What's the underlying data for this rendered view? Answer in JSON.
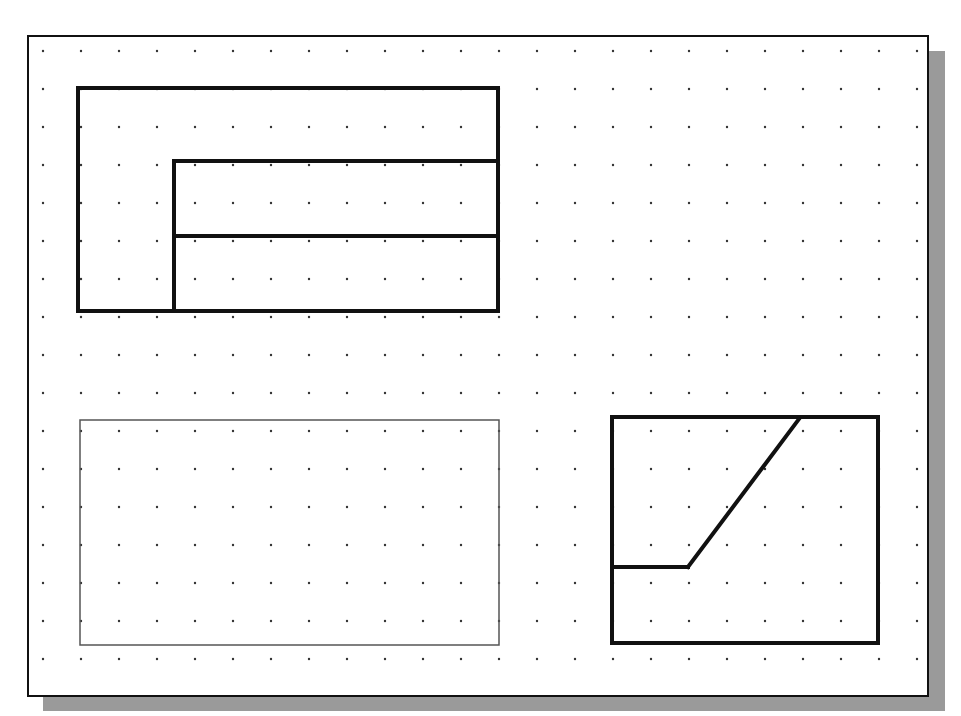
{
  "canvas": {
    "width": 961,
    "height": 716,
    "background": "#ffffff"
  },
  "sheet": {
    "x": 27,
    "y": 35,
    "width": 900,
    "height": 660,
    "border_color": "#111111",
    "shadow_color": "#9a9a9a",
    "shadow_offset": 16
  },
  "grid": {
    "origin_x": 43,
    "origin_y": 51,
    "spacing": 38,
    "cols": 24,
    "rows": 17,
    "dot_color": "#333333",
    "dot_radius": 1.2
  },
  "shapes": [
    {
      "name": "top-view-outer-rect",
      "type": "rect",
      "x": 78,
      "y": 88,
      "width": 420,
      "height": 223,
      "stroke": "#111111",
      "stroke_width": 4
    },
    {
      "name": "top-view-inner-vertical",
      "type": "line",
      "x1": 174,
      "y1": 161,
      "x2": 174,
      "y2": 311,
      "stroke": "#111111",
      "stroke_width": 4
    },
    {
      "name": "top-view-inner-top",
      "type": "line",
      "x1": 174,
      "y1": 161,
      "x2": 498,
      "y2": 161,
      "stroke": "#111111",
      "stroke_width": 4
    },
    {
      "name": "top-view-inner-middle",
      "type": "line",
      "x1": 174,
      "y1": 236,
      "x2": 498,
      "y2": 236,
      "stroke": "#111111",
      "stroke_width": 4
    },
    {
      "name": "front-view-construction-rect",
      "type": "rect",
      "x": 80,
      "y": 420,
      "width": 419,
      "height": 225,
      "stroke": "#555555",
      "stroke_width": 1.5
    },
    {
      "name": "side-view-outer-rect",
      "type": "rect",
      "x": 612,
      "y": 417,
      "width": 266,
      "height": 226,
      "stroke": "#111111",
      "stroke_width": 4
    },
    {
      "name": "side-view-horizontal-edge",
      "type": "line",
      "x1": 612,
      "y1": 567,
      "x2": 688,
      "y2": 567,
      "stroke": "#111111",
      "stroke_width": 4
    },
    {
      "name": "side-view-inclined-edge",
      "type": "line",
      "x1": 688,
      "y1": 567,
      "x2": 799,
      "y2": 419,
      "stroke": "#111111",
      "stroke_width": 4
    }
  ]
}
